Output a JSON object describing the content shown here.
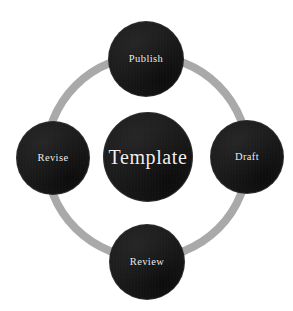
{
  "diagram": {
    "type": "cycle",
    "background_color": "#ffffff",
    "ring": {
      "color": "#a9a9a9",
      "thickness_px": 8,
      "center_x": 147,
      "center_y": 157,
      "radius_px": 105
    },
    "center_node": {
      "label": "Template",
      "fill_color": "#191919",
      "text_color": "#f2f0ee",
      "diameter_px": 88,
      "center_x": 148,
      "center_y": 157
    },
    "nodes": [
      {
        "id": "publish",
        "label": "Publish",
        "position": "top",
        "fill_color": "#191919",
        "text_color": "#f2f0ee",
        "diameter_px": 74,
        "center_x": 146,
        "center_y": 59
      },
      {
        "id": "draft",
        "label": "Draft",
        "position": "right",
        "fill_color": "#191919",
        "text_color": "#f2f0ee",
        "diameter_px": 72,
        "center_x": 247,
        "center_y": 157
      },
      {
        "id": "review",
        "label": "Review",
        "position": "bottom",
        "fill_color": "#191919",
        "text_color": "#f2f0ee",
        "diameter_px": 74,
        "center_x": 147,
        "center_y": 262
      },
      {
        "id": "revise",
        "label": "Revise",
        "position": "left",
        "fill_color": "#191919",
        "text_color": "#f2f0ee",
        "diameter_px": 72,
        "center_x": 53,
        "center_y": 158
      }
    ]
  }
}
